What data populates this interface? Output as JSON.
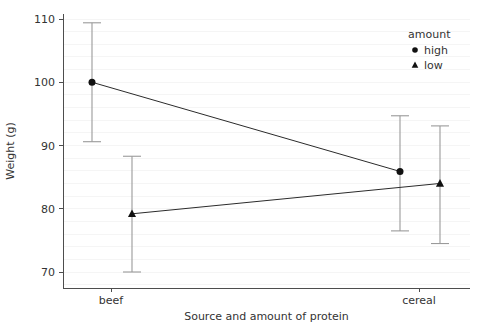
{
  "chart_data": {
    "type": "line",
    "title": "",
    "subtitle": "",
    "xlabel": "Source and amount of protein",
    "ylabel": "Weight (g)",
    "categories": [
      "beef",
      "cereal"
    ],
    "xticklabels": [
      "beef",
      "cereal"
    ],
    "yticklabels": [
      "70",
      "80",
      "90",
      "100",
      "110"
    ],
    "yticks": [
      70,
      80,
      90,
      100,
      110
    ],
    "ylim": [
      67.5,
      111.5
    ],
    "grid": true,
    "grid_axis": "y",
    "legend": {
      "title": "amount",
      "position": "top-right",
      "entries": [
        {
          "label": "high",
          "marker": "circle"
        },
        {
          "label": "low",
          "marker": "triangle"
        }
      ]
    },
    "series": [
      {
        "name": "high",
        "marker": "circle",
        "values": [
          100.0,
          85.9
        ],
        "errors_low": [
          90.6,
          76.5
        ],
        "errors_high": [
          109.4,
          94.7
        ]
      },
      {
        "name": "low",
        "marker": "triangle",
        "values": [
          79.2,
          84.0
        ],
        "errors_low": [
          70.0,
          74.5
        ],
        "errors_high": [
          88.3,
          93.1
        ]
      }
    ],
    "colors": {
      "marker": "#111111",
      "line": "#2b2b2b",
      "errorbar": "#9a9a9a",
      "axis": "#4d4d4d",
      "grid": "#f2f2f2",
      "text": "#333333",
      "background": "#ffffff"
    }
  }
}
